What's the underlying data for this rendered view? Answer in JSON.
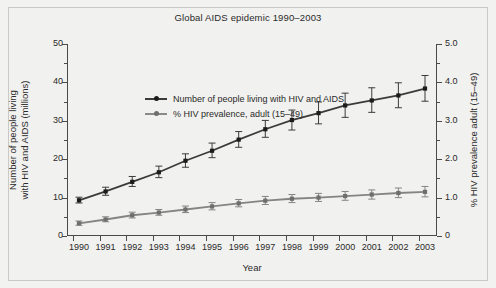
{
  "chart_data": {
    "type": "line",
    "title": "Global AIDS epidemic 1990–2003",
    "xlabel": "Year",
    "ylabel": "Number of people living with HIV and AIDS (millions)",
    "ylabel_line1": "Number of people living",
    "ylabel_line2": "with HIV and AIDS (millions)",
    "y2label": "% HIV prevalence adult (15–49)",
    "grid": false,
    "legend_position": "top-left",
    "categories": [
      "1990",
      "1991",
      "1992",
      "1993",
      "1994",
      "1995",
      "1996",
      "1997",
      "1998",
      "1999",
      "2000",
      "2001",
      "2002",
      "2003"
    ],
    "x": [
      1990,
      1991,
      1992,
      1993,
      1994,
      1995,
      1996,
      1997,
      1998,
      1999,
      2000,
      2001,
      2002,
      2003
    ],
    "ylim": [
      0,
      50
    ],
    "yticks": [
      "0",
      "10",
      "20",
      "30",
      "40",
      "50"
    ],
    "ytick_values": [
      0,
      10,
      20,
      30,
      40,
      50
    ],
    "y2lim": [
      0,
      5.0
    ],
    "y2ticks": [
      "0",
      "1.0",
      "2.0",
      "3.0",
      "4.0",
      "5.0"
    ],
    "y2tick_values": [
      0,
      1.0,
      2.0,
      3.0,
      4.0,
      5.0
    ],
    "series": [
      {
        "name": "Number of people living with HIV and AIDS",
        "axis": "left",
        "color": "#3b3b3b",
        "marker": "square-dot",
        "values": [
          9.3,
          11.6,
          14.1,
          16.6,
          19.6,
          22.2,
          25.1,
          27.8,
          30.2,
          32.0,
          34.0,
          35.3,
          36.6,
          38.4
        ],
        "err_low": [
          8.6,
          10.6,
          12.9,
          15.2,
          17.9,
          20.4,
          23.1,
          25.7,
          27.6,
          29.2,
          30.9,
          32.2,
          33.4,
          35.1
        ],
        "err_high": [
          10.1,
          12.7,
          15.5,
          18.2,
          21.4,
          24.2,
          27.2,
          30.1,
          32.8,
          34.9,
          37.2,
          38.6,
          39.9,
          41.8
        ]
      },
      {
        "name": "% HIV prevalence, adult (15–49)",
        "axis": "right",
        "color": "#848484",
        "marker": "square-dot",
        "values": [
          0.33,
          0.43,
          0.54,
          0.61,
          0.69,
          0.77,
          0.85,
          0.92,
          0.97,
          1.0,
          1.04,
          1.08,
          1.12,
          1.15
        ],
        "err_low": [
          0.28,
          0.37,
          0.47,
          0.54,
          0.61,
          0.68,
          0.76,
          0.82,
          0.87,
          0.9,
          0.93,
          0.96,
          1.0,
          1.02
        ],
        "err_high": [
          0.39,
          0.5,
          0.62,
          0.69,
          0.78,
          0.87,
          0.95,
          1.03,
          1.08,
          1.11,
          1.16,
          1.2,
          1.25,
          1.29
        ]
      }
    ]
  },
  "legend": {
    "items": [
      {
        "label": "Number of people living with HIV and AIDS",
        "color": "#3b3b3b"
      },
      {
        "label": "% HIV prevalence, adult (15–49)",
        "color": "#848484"
      }
    ]
  },
  "colors": {
    "background": "#f1f1ef",
    "frame": "#c9c9c7",
    "axis": "#4a4a4a",
    "text": "#2a2a2a",
    "series1": "#3b3b3b",
    "series2": "#848484"
  }
}
